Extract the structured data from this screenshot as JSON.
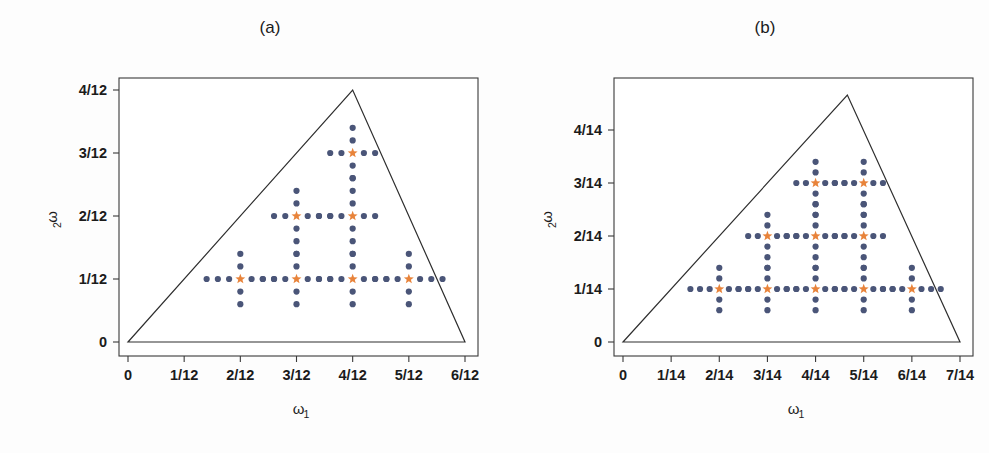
{
  "figure": {
    "background": "#ffffff",
    "dot_color": "#4a5578",
    "star_color": "#e8833a",
    "axis_color": "#2e2e2e"
  },
  "panels": [
    {
      "id": "a",
      "title": "(a)",
      "denominator": 12,
      "xlabel": "ω",
      "xlabel_sub": "1",
      "ylabel": "ω",
      "ylabel_sub": "2",
      "xticks": [
        "0",
        "1/12",
        "2/12",
        "3/12",
        "4/12",
        "5/12",
        "6/12"
      ],
      "xtick_values": [
        0,
        1,
        2,
        3,
        4,
        5,
        6
      ],
      "yticks": [
        "0",
        "1/12",
        "2/12",
        "3/12",
        "4/12"
      ],
      "ytick_values": [
        0,
        1,
        2,
        3,
        4
      ],
      "xlim": [
        0,
        6
      ],
      "ylim": [
        0,
        4
      ],
      "triangle": [
        [
          0,
          0
        ],
        [
          6,
          0
        ],
        [
          4,
          4
        ]
      ],
      "stars": [
        [
          2,
          1
        ],
        [
          3,
          1
        ],
        [
          4,
          1
        ],
        [
          5,
          1
        ],
        [
          3,
          2
        ],
        [
          4,
          2
        ],
        [
          4,
          3
        ]
      ],
      "arm_offsets": [
        0.2,
        0.4,
        0.6
      ],
      "arm_counts": {
        "2,1": {
          "left": 3,
          "right": 3,
          "up": 2,
          "down": 2
        },
        "3,1": {
          "left": 3,
          "right": 3,
          "up": 2,
          "down": 2
        },
        "4,1": {
          "left": 3,
          "right": 3,
          "up": 2,
          "down": 2
        },
        "5,1": {
          "left": 3,
          "right": 3,
          "up": 2,
          "down": 2
        },
        "3,2": {
          "left": 2,
          "right": 3,
          "up": 2,
          "down": 3
        },
        "4,2": {
          "left": 3,
          "right": 2,
          "up": 3,
          "down": 3
        },
        "4,3": {
          "left": 2,
          "right": 2,
          "up": 2,
          "down": 2
        }
      }
    },
    {
      "id": "b",
      "title": "(b)",
      "denominator": 14,
      "xlabel": "ω",
      "xlabel_sub": "1",
      "ylabel": "ω",
      "ylabel_sub": "2",
      "xticks": [
        "0",
        "1/14",
        "2/14",
        "3/14",
        "4/14",
        "5/14",
        "6/14",
        "7/14"
      ],
      "xtick_values": [
        0,
        1,
        2,
        3,
        4,
        5,
        6,
        7
      ],
      "yticks": [
        "0",
        "1/14",
        "2/14",
        "3/14",
        "4/14"
      ],
      "ytick_values": [
        0,
        1,
        2,
        3,
        4
      ],
      "xlim": [
        0,
        7
      ],
      "ylim": [
        0,
        4.6
      ],
      "triangle": [
        [
          0,
          0
        ],
        [
          7,
          0
        ],
        [
          4.66,
          4.66
        ]
      ],
      "stars": [
        [
          2,
          1
        ],
        [
          3,
          1
        ],
        [
          4,
          1
        ],
        [
          5,
          1
        ],
        [
          6,
          1
        ],
        [
          3,
          2
        ],
        [
          4,
          2
        ],
        [
          5,
          2
        ],
        [
          4,
          3
        ],
        [
          5,
          3
        ]
      ],
      "arm_offsets": [
        0.2,
        0.4,
        0.6
      ],
      "arm_counts": {
        "2,1": {
          "left": 3,
          "right": 3,
          "up": 2,
          "down": 2
        },
        "3,1": {
          "left": 3,
          "right": 3,
          "up": 2,
          "down": 2
        },
        "4,1": {
          "left": 3,
          "right": 3,
          "up": 2,
          "down": 2
        },
        "5,1": {
          "left": 3,
          "right": 3,
          "up": 2,
          "down": 2
        },
        "6,1": {
          "left": 3,
          "right": 3,
          "up": 2,
          "down": 2
        },
        "3,2": {
          "left": 2,
          "right": 3,
          "up": 2,
          "down": 3
        },
        "4,2": {
          "left": 3,
          "right": 3,
          "up": 3,
          "down": 3
        },
        "5,2": {
          "left": 3,
          "right": 2,
          "up": 3,
          "down": 3
        },
        "4,3": {
          "left": 2,
          "right": 3,
          "up": 2,
          "down": 3
        },
        "5,3": {
          "left": 3,
          "right": 2,
          "up": 2,
          "down": 3
        }
      }
    }
  ],
  "chart_data": {
    "type": "scatter",
    "title": "",
    "panel_count": 2,
    "grid": false,
    "legend": null,
    "panels": [
      {
        "label": "(a)",
        "xlabel": "ω₁",
        "ylabel": "ω₂",
        "xlim": [
          0,
          0.5
        ],
        "ylim": [
          0,
          0.3333
        ],
        "xticks": [
          0,
          0.0833,
          0.1667,
          0.25,
          0.3333,
          0.4167,
          0.5
        ],
        "xticklabels": [
          "0",
          "1/12",
          "2/12",
          "3/12",
          "4/12",
          "5/12",
          "6/12"
        ],
        "yticks": [
          0,
          0.0833,
          0.1667,
          0.25,
          0.3333
        ],
        "yticklabels": [
          "0",
          "1/12",
          "2/12",
          "3/12",
          "4/12"
        ],
        "boundary_polygon_fractions": [
          [
            0,
            0
          ],
          [
            6,
            0
          ],
          [
            4,
            4
          ]
        ],
        "series": [
          {
            "name": "cluster centres (star)",
            "marker": "star",
            "color": "#e8833a",
            "points_in_twelfths": [
              [
                2,
                1
              ],
              [
                3,
                1
              ],
              [
                4,
                1
              ],
              [
                5,
                1
              ],
              [
                3,
                2
              ],
              [
                4,
                2
              ],
              [
                4,
                3
              ]
            ]
          },
          {
            "name": "support points (dot)",
            "marker": "circle",
            "color": "#4a5578",
            "description": "Four-armed crosses centred on each star; arm steps of 1/60 in ω₁ and ω₂",
            "arm_step_in_twelfths": 0.2,
            "arms_per_centre": {
              "2,1": {
                "left": 3,
                "right": 3,
                "up": 2,
                "down": 2
              },
              "3,1": {
                "left": 3,
                "right": 3,
                "up": 2,
                "down": 2
              },
              "4,1": {
                "left": 3,
                "right": 3,
                "up": 2,
                "down": 2
              },
              "5,1": {
                "left": 3,
                "right": 3,
                "up": 2,
                "down": 2
              },
              "3,2": {
                "left": 2,
                "right": 3,
                "up": 2,
                "down": 3
              },
              "4,2": {
                "left": 3,
                "right": 2,
                "up": 3,
                "down": 3
              },
              "4,3": {
                "left": 2,
                "right": 2,
                "up": 2,
                "down": 2
              }
            }
          }
        ]
      },
      {
        "label": "(b)",
        "xlabel": "ω₁",
        "ylabel": "ω₂",
        "xlim": [
          0,
          0.5
        ],
        "ylim": [
          0,
          0.3329
        ],
        "xticks": [
          0,
          0.0714,
          0.1429,
          0.2143,
          0.2857,
          0.3571,
          0.4286,
          0.5
        ],
        "xticklabels": [
          "0",
          "1/14",
          "2/14",
          "3/14",
          "4/14",
          "5/14",
          "6/14",
          "7/14"
        ],
        "yticks": [
          0,
          0.0714,
          0.1429,
          0.2143,
          0.2857
        ],
        "yticklabels": [
          "0",
          "1/14",
          "2/14",
          "3/14",
          "4/14"
        ],
        "boundary_polygon_fractions": [
          [
            0,
            0
          ],
          [
            7,
            0
          ],
          [
            4.66,
            4.66
          ]
        ],
        "series": [
          {
            "name": "cluster centres (star)",
            "marker": "star",
            "color": "#e8833a",
            "points_in_fourteenths": [
              [
                2,
                1
              ],
              [
                3,
                1
              ],
              [
                4,
                1
              ],
              [
                5,
                1
              ],
              [
                6,
                1
              ],
              [
                3,
                2
              ],
              [
                4,
                2
              ],
              [
                5,
                2
              ],
              [
                4,
                3
              ],
              [
                5,
                3
              ]
            ]
          },
          {
            "name": "support points (dot)",
            "marker": "circle",
            "color": "#4a5578",
            "description": "Four-armed crosses centred on each star; arm steps of 1/70 in ω₁ and ω₂",
            "arm_step_in_fourteenths": 0.2,
            "arms_per_centre": {
              "2,1": {
                "left": 3,
                "right": 3,
                "up": 2,
                "down": 2
              },
              "3,1": {
                "left": 3,
                "right": 3,
                "up": 2,
                "down": 2
              },
              "4,1": {
                "left": 3,
                "right": 3,
                "up": 2,
                "down": 2
              },
              "5,1": {
                "left": 3,
                "right": 3,
                "up": 2,
                "down": 2
              },
              "6,1": {
                "left": 3,
                "right": 3,
                "up": 2,
                "down": 2
              },
              "3,2": {
                "left": 2,
                "right": 3,
                "up": 2,
                "down": 3
              },
              "4,2": {
                "left": 3,
                "right": 3,
                "up": 3,
                "down": 3
              },
              "5,2": {
                "left": 3,
                "right": 2,
                "up": 3,
                "down": 3
              },
              "4,3": {
                "left": 2,
                "right": 3,
                "up": 2,
                "down": 3
              },
              "5,3": {
                "left": 3,
                "right": 2,
                "up": 2,
                "down": 3
              }
            }
          }
        ]
      }
    ]
  }
}
